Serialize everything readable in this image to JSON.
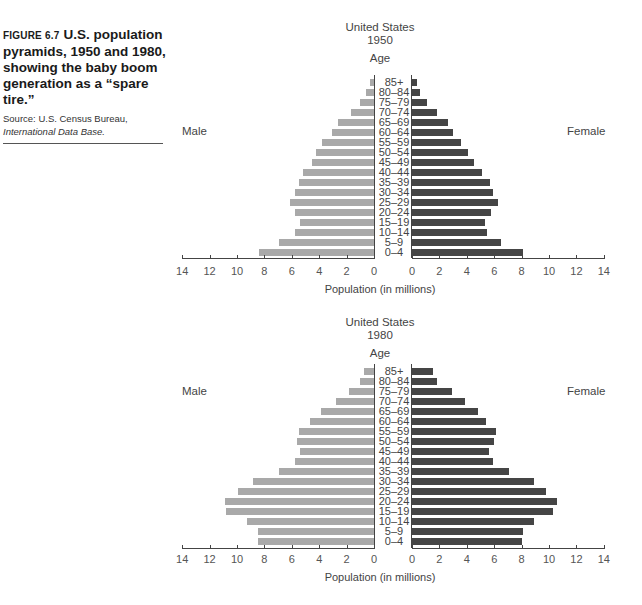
{
  "caption": {
    "figure_label": "FIGURE 6.7",
    "title": "U.S. population pyramids, 1950 and 1980, showing the baby boom generation as a “spare tire.”",
    "source_prefix": "Source: U.S. Census Bureau, ",
    "source_italic": "International Data Base."
  },
  "colors": {
    "male": "#a9a9a9",
    "female": "#454545"
  },
  "chart_data": [
    {
      "type": "bar",
      "subtype": "population-pyramid",
      "title": "United States",
      "subtitle": "1950",
      "ylabel": "Age",
      "xlabel": "Population (in millions)",
      "left_label": "Male",
      "right_label": "Female",
      "xlim": [
        0,
        14
      ],
      "xticks": [
        "14",
        "12",
        "10",
        "8",
        "6",
        "4",
        "2",
        "0",
        "0",
        "2",
        "4",
        "6",
        "8",
        "10",
        "12",
        "14"
      ],
      "categories": [
        "85+",
        "80–84",
        "75–79",
        "70–74",
        "65–69",
        "60–64",
        "55–59",
        "50–54",
        "45–49",
        "40–44",
        "35–39",
        "30–34",
        "25–29",
        "20–24",
        "15–19",
        "10–14",
        "5–9",
        "0–4"
      ],
      "series": [
        {
          "name": "Male",
          "values": [
            0.3,
            0.6,
            1.0,
            1.7,
            2.6,
            3.1,
            3.8,
            4.2,
            4.5,
            5.2,
            5.5,
            5.8,
            6.1,
            5.8,
            5.4,
            5.8,
            6.9,
            8.4
          ]
        },
        {
          "name": "Female",
          "values": [
            0.4,
            0.6,
            1.1,
            1.8,
            2.6,
            3.0,
            3.6,
            4.1,
            4.5,
            5.1,
            5.7,
            5.9,
            6.3,
            5.8,
            5.3,
            5.5,
            6.5,
            8.1
          ]
        }
      ],
      "grid": false
    },
    {
      "type": "bar",
      "subtype": "population-pyramid",
      "title": "United States",
      "subtitle": "1980",
      "ylabel": "Age",
      "xlabel": "Population (in millions)",
      "left_label": "Male",
      "right_label": "Female",
      "xlim": [
        0,
        14
      ],
      "xticks": [
        "14",
        "12",
        "10",
        "8",
        "6",
        "4",
        "2",
        "0",
        "0",
        "2",
        "4",
        "6",
        "8",
        "10",
        "12",
        "14"
      ],
      "categories": [
        "85+",
        "80–84",
        "75–79",
        "70–74",
        "65–69",
        "60–64",
        "55–59",
        "50–54",
        "45–49",
        "40–44",
        "35–39",
        "30–34",
        "25–29",
        "20–24",
        "15–19",
        "10–14",
        "5–9",
        "0–4"
      ],
      "series": [
        {
          "name": "Male",
          "values": [
            0.7,
            1.0,
            1.8,
            2.8,
            3.9,
            4.7,
            5.5,
            5.6,
            5.4,
            5.8,
            6.9,
            8.8,
            9.9,
            10.9,
            10.8,
            9.3,
            8.5,
            8.5
          ]
        },
        {
          "name": "Female",
          "values": [
            1.5,
            1.8,
            2.9,
            3.9,
            4.8,
            5.4,
            6.1,
            6.0,
            5.6,
            5.9,
            7.1,
            8.9,
            9.8,
            10.6,
            10.3,
            8.9,
            8.1,
            8.0
          ]
        }
      ],
      "grid": false
    }
  ]
}
